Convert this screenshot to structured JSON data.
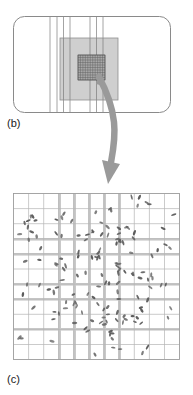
{
  "figure": {
    "type": "diagram",
    "caption_labels": {
      "panel_b": "(b)",
      "panel_c": "(c)"
    },
    "panels": [
      {
        "id": "b",
        "label": "(b)",
        "description": "rounded-rectangle field of view with vertical stripe lines, a light gray magnification square and a dark fine grid inset",
        "bounds": {
          "x": 13,
          "y": 16,
          "width": 158,
          "height": 97,
          "corner_radius": 11
        },
        "stroke_color": "#8a8a8a",
        "fill_color": "#ffffff",
        "vertical_lines_x": [
          50,
          57,
          63.5,
          70,
          90,
          96.5,
          103
        ],
        "vertical_line_color": "#9a9a9a",
        "gray_square": {
          "x": 60,
          "y": 38,
          "width": 58,
          "height": 62,
          "fill": "#cfcfcf",
          "stroke": "#8f8f8f"
        },
        "inner_grid": {
          "x": 78,
          "y": 55,
          "width": 27,
          "height": 25,
          "fill": "#a8a8a8",
          "cells_x": 11,
          "cells_y": 10,
          "line_color": "#5f5f5f"
        }
      },
      {
        "id": "c",
        "label": "(c)",
        "description": "magnified square grid populated with small dark rod-shaped particles, density increasing toward the center",
        "bounds": {
          "x": 13,
          "y": 193,
          "width": 167,
          "height": 167
        },
        "grid": {
          "columns": 11,
          "rows": 11,
          "thin_line_color": "#b5b5b5",
          "band_color": "#c9c9c9",
          "border_color": "#9c9c9c"
        },
        "band_columns": [
          3,
          5,
          7
        ],
        "band_rows": [
          3,
          5,
          7
        ],
        "particle_color": "#5a5a5a",
        "particle_count": 152
      }
    ],
    "arrow": {
      "name": "curved-arrow",
      "color": "#9a9a9a",
      "from": {
        "x": 100,
        "y": 78
      },
      "to": {
        "x": 110,
        "y": 182
      },
      "description": "thick curved arrow pointing from the inset grid in panel (b) down to panel (c)"
    },
    "colors": {
      "ink": "#1a1a1a",
      "line": "#8a8a8a",
      "light_fill": "#cfcfcf",
      "dark_fill": "#a8a8a8",
      "arrow": "#9a9a9a",
      "particle": "#5a5a5a",
      "background": "#ffffff"
    }
  }
}
